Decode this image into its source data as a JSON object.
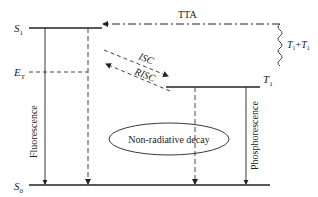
{
  "diagram": {
    "type": "jablonski-energy-level",
    "levels": {
      "s1": "S",
      "s1_sub": "1",
      "et": "E",
      "et_sub": "T",
      "t1": "T",
      "t1_sub": "1",
      "s0": "S",
      "s0_sub": "0"
    },
    "processes": {
      "tta": "TTA",
      "isc": "ISC",
      "risc": "RISC",
      "tt_pair_a": "T",
      "tt_pair_a_sub": "1",
      "tt_plus": "+",
      "tt_pair_b": "T",
      "tt_pair_b_sub": "1",
      "fluorescence": "Fluorescence",
      "phosphorescence": "Phosphorescence",
      "non_radiative": "Non-radiative decay"
    },
    "colors": {
      "line": "#222222",
      "dashed": "#444444",
      "background": "#ffffff"
    }
  }
}
